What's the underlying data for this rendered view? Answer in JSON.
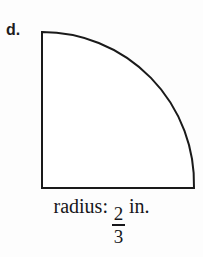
{
  "figure": {
    "part_label": "d.",
    "shape_name": "quarter-circle",
    "stroke_color": "#1a1a1a",
    "fill_color": "#ffffff",
    "background_color": "#fdfdfd",
    "geometry": {
      "center_x": 42,
      "center_y": 188,
      "radius_px": 152,
      "top_point_x": 42,
      "top_point_y": 32,
      "right_point_x": 194,
      "right_point_y": 188,
      "stroke_width": 2
    }
  },
  "caption": {
    "prefix": "radius:",
    "fraction": {
      "numerator": "2",
      "denominator": "3"
    },
    "unit": "in.",
    "full_text": "radius: 2/3 in."
  }
}
